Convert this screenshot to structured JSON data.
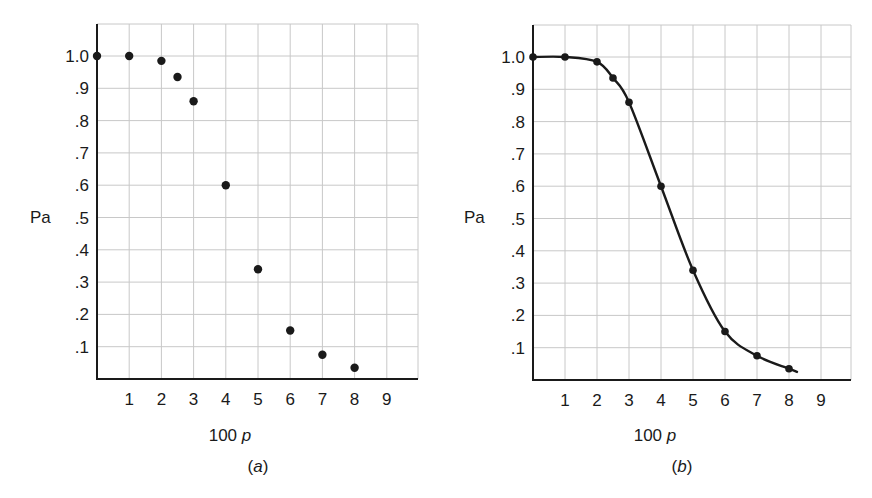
{
  "chart_data": [
    {
      "type": "scatter",
      "panel_label": "(a)",
      "panel_letter": "a",
      "title": "",
      "xlabel": "100 p",
      "xlabel_num": "100",
      "xlabel_var": "p",
      "ylabel": "Pa",
      "x_ticks": [
        "1",
        "2",
        "3",
        "4",
        "5",
        "6",
        "7",
        "8",
        "9"
      ],
      "y_ticks": [
        ".1",
        ".2",
        ".3",
        ".4",
        ".5",
        ".6",
        ".7",
        ".8",
        ".9",
        "1.0"
      ],
      "xlim": [
        0,
        10
      ],
      "ylim": [
        0,
        1.1
      ],
      "grid": true,
      "legend": null,
      "series": [
        {
          "name": "Pa",
          "x": [
            0,
            1,
            2,
            2.5,
            3,
            4,
            5,
            6,
            7,
            8
          ],
          "y": [
            1.0,
            1.0,
            0.985,
            0.935,
            0.86,
            0.6,
            0.34,
            0.15,
            0.075,
            0.035
          ],
          "style": "points"
        }
      ]
    },
    {
      "type": "line",
      "panel_label": "(b)",
      "panel_letter": "b",
      "title": "",
      "xlabel": "100 p",
      "xlabel_num": "100",
      "xlabel_var": "p",
      "ylabel": "Pa",
      "x_ticks": [
        "1",
        "2",
        "3",
        "4",
        "5",
        "6",
        "7",
        "8",
        "9"
      ],
      "y_ticks": [
        ".1",
        ".2",
        ".3",
        ".4",
        ".5",
        ".6",
        ".7",
        ".8",
        ".9",
        "1.0"
      ],
      "xlim": [
        0,
        10
      ],
      "ylim": [
        0,
        1.1
      ],
      "grid": true,
      "legend": null,
      "series": [
        {
          "name": "Pa",
          "x": [
            0,
            1,
            2,
            2.5,
            3,
            4,
            5,
            6,
            7,
            8
          ],
          "y": [
            1.0,
            1.0,
            0.985,
            0.935,
            0.86,
            0.6,
            0.34,
            0.15,
            0.075,
            0.035
          ],
          "style": "points+smooth-curve"
        }
      ]
    }
  ],
  "colors": {
    "ink": "#1a1a1a",
    "grid": "#c8c8c8",
    "background": "#ffffff"
  }
}
